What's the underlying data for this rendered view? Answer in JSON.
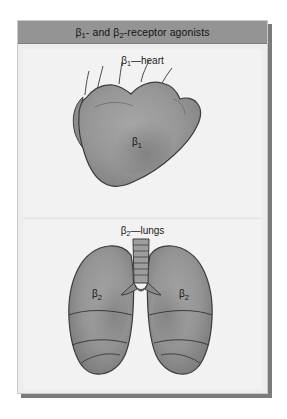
{
  "figure": {
    "title_parts": {
      "beta1": "β",
      "sub1": "1",
      "mid": "- and ",
      "beta2": "β",
      "sub2": "2",
      "tail": "-receptor agonists"
    },
    "colors": {
      "title_bar": "#949494",
      "card_background": "#eceded",
      "panel_background": "#f2f2f2",
      "shadow": "#7b7b7b",
      "organ_fill": "#9a9a9a",
      "organ_shade": "#7d7d7d",
      "organ_outline": "#3c3c3c",
      "text": "#131313"
    },
    "sections": [
      {
        "id": "heart",
        "label": "β₂—heart",
        "label_parts": {
          "beta": "β",
          "sub": "1",
          "dash": "—",
          "organ": "heart"
        },
        "organ_name": "heart-illustration",
        "receptor_markers": [
          {
            "label_beta": "β",
            "label_sub": "1",
            "x": 120,
            "y": 92
          }
        ]
      },
      {
        "id": "lungs",
        "label": "β₂—lungs",
        "label_parts": {
          "beta": "β",
          "sub": "2",
          "dash": "—",
          "organ": "lungs"
        },
        "organ_name": "lungs-illustration",
        "receptor_markers": [
          {
            "label_beta": "β",
            "label_sub": "2",
            "x": 72,
            "y": 98
          },
          {
            "label_beta": "β",
            "label_sub": "2",
            "x": 163,
            "y": 98
          }
        ]
      }
    ]
  }
}
